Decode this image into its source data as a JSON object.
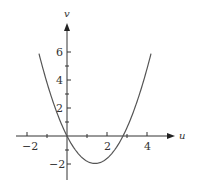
{
  "chart_data": {
    "type": "line",
    "title": "",
    "xlabel": "u",
    "ylabel": "v",
    "function": "v = u^2 - 2.8u",
    "x": [
      -1.4,
      -1.0,
      -0.5,
      0,
      0.5,
      1.0,
      1.4,
      2.0,
      2.5,
      2.8,
      3.0,
      3.5,
      4.0,
      4.2
    ],
    "series": [
      {
        "name": "parabola",
        "values": [
          5.88,
          3.8,
          1.65,
          0,
          -1.15,
          -1.8,
          -1.96,
          -1.6,
          -0.75,
          0,
          0.6,
          2.45,
          4.8,
          5.88
        ]
      }
    ],
    "xticks": [
      -2,
      2,
      4
    ],
    "yticks": [
      -2,
      2,
      4,
      6
    ],
    "xlim": [
      -2.5,
      4.7
    ],
    "ylim": [
      -3,
      7
    ],
    "grid": false,
    "legend": "none",
    "colors": {
      "curve": "#555555",
      "axes": "#333333"
    }
  },
  "labels": {
    "x_axis": "u",
    "y_axis": "v",
    "xtick_neg2": "−2",
    "xtick_2": "2",
    "xtick_4": "4",
    "ytick_neg2": "−2",
    "ytick_2": "2",
    "ytick_4": "4",
    "ytick_6": "6"
  }
}
